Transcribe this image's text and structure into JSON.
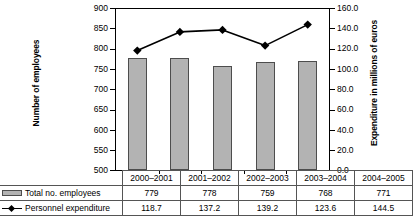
{
  "chart_data": {
    "type": "bar",
    "title": "",
    "categories": [
      "2000–2001",
      "2001–2002",
      "2002–2003",
      "2003–2004",
      "2004–2005"
    ],
    "series": [
      {
        "name": "Total no. employees",
        "type": "bar",
        "axis": "left",
        "values": [
          779,
          778,
          759,
          768,
          771
        ]
      },
      {
        "name": "Personnel expenditure",
        "type": "line",
        "axis": "right",
        "values": [
          118.7,
          137.2,
          139.2,
          123.6,
          144.5
        ]
      }
    ],
    "xlabel": "",
    "ylabel": "Number of employees",
    "y2label": "Expenditure in millions of euros",
    "ylim": [
      500,
      900
    ],
    "y2lim": [
      0.0,
      160.0
    ],
    "yticks": [
      "900",
      "850",
      "800",
      "750",
      "700",
      "650",
      "600",
      "550",
      "500"
    ],
    "y2ticks": [
      "160.0",
      "140.0",
      "120.0",
      "100.0",
      "80.0",
      "60.0",
      "40.0",
      "20.0",
      "0.0"
    ],
    "grid": false,
    "legend": "bottom-table",
    "colors": {
      "bar_fill": "#b3b3b3",
      "bar_border": "#4d4d4d",
      "line": "#000000",
      "marker": "#000000",
      "axis": "#000000",
      "background": "#ffffff"
    }
  },
  "table": {
    "row_labels": [
      "Total no. employees",
      "Personnel expenditure"
    ],
    "legend_icons": [
      "bar-swatch-icon",
      "line-marker-icon"
    ],
    "header": [
      "2000–2001",
      "2001–2002",
      "2002–2003",
      "2003–2004",
      "2004–2005"
    ],
    "rows": [
      [
        "779",
        "778",
        "759",
        "768",
        "771"
      ],
      [
        "118.7",
        "137.2",
        "139.2",
        "123.6",
        "144.5"
      ]
    ]
  }
}
